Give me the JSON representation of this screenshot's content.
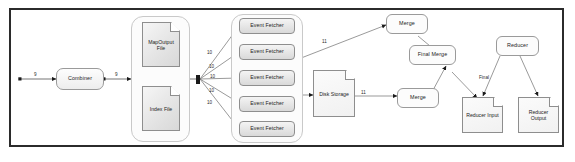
{
  "diagram": {
    "type": "flowchart",
    "frame": {
      "border_color": "#2b2b2b",
      "background": "#ffffff"
    },
    "nodes": {
      "combiner": {
        "label": "Combiner",
        "shape": "rounded-rect"
      },
      "map_output_file": {
        "label": "MapOutput File",
        "shape": "document"
      },
      "index_file": {
        "label": "Index File",
        "shape": "document"
      },
      "event_fetcher_1": {
        "label": "Event Fetcher",
        "shape": "rounded-rect"
      },
      "event_fetcher_2": {
        "label": "Event Fetcher",
        "shape": "rounded-rect"
      },
      "event_fetcher_3": {
        "label": "Event Fetcher",
        "shape": "rounded-rect"
      },
      "event_fetcher_4": {
        "label": "Event Fetcher",
        "shape": "rounded-rect"
      },
      "event_fetcher_5": {
        "label": "Event Fetcher",
        "shape": "rounded-rect"
      },
      "disk_storage": {
        "label": "Disk Storage",
        "shape": "document"
      },
      "merge_top": {
        "label": "Merge",
        "shape": "rounded-rect"
      },
      "merge_bottom": {
        "label": "Merge",
        "shape": "rounded-rect"
      },
      "final_merge": {
        "label": "Final Merge",
        "shape": "rounded-rect"
      },
      "reducer": {
        "label": "Reducer",
        "shape": "rounded-rect"
      },
      "reducer_input": {
        "label": "Reducer Input",
        "shape": "document"
      },
      "reducer_output": {
        "label": "Reducer Output",
        "shape": "document"
      }
    },
    "edge_labels": {
      "start_to_combiner": "9",
      "combiner_to_files": "9",
      "hub_to_fetcher_1": "10",
      "hub_to_fetcher_2": "10",
      "hub_to_fetcher_3": "10",
      "hub_to_fetcher_4": "10",
      "hub_to_fetcher_5": "10",
      "fetchers_to_merge_top": "11",
      "disk_to_merge_bottom": "11",
      "reducer_to_input": "Final"
    }
  }
}
